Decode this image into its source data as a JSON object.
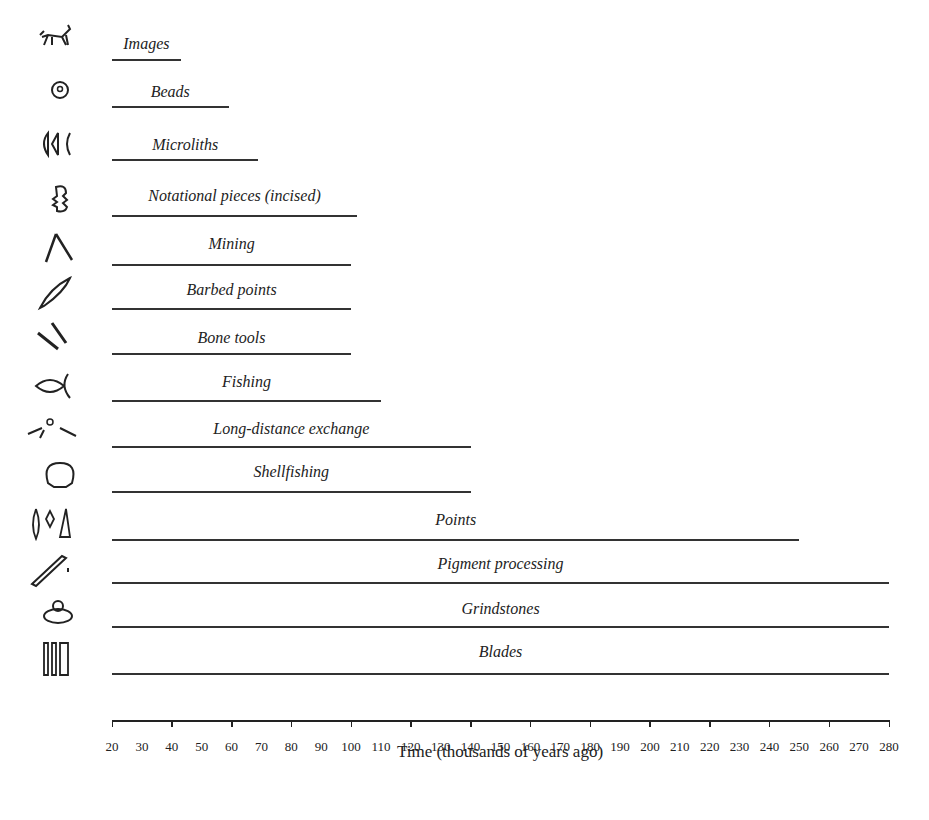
{
  "chart_data": {
    "type": "bar",
    "orientation": "horizontal-timeline",
    "title": "",
    "xlabel": "Time (thousands of years ago)",
    "ylabel": "",
    "xlim": [
      20,
      280
    ],
    "xticks": [
      20,
      30,
      40,
      50,
      60,
      70,
      80,
      90,
      100,
      110,
      120,
      130,
      140,
      150,
      160,
      170,
      180,
      190,
      200,
      210,
      220,
      230,
      240,
      250,
      260,
      270,
      280
    ],
    "grid": false,
    "legend": "none",
    "series": [
      {
        "name": "Images",
        "start": 20,
        "end": 43,
        "icon": "animal-figure-icon"
      },
      {
        "name": "Beads",
        "start": 20,
        "end": 59,
        "icon": "bead-icon"
      },
      {
        "name": "Microliths",
        "start": 20,
        "end": 69,
        "icon": "microliths-icon"
      },
      {
        "name": "Notational pieces (incised)",
        "start": 20,
        "end": 102,
        "icon": "incised-piece-icon"
      },
      {
        "name": "Mining",
        "start": 20,
        "end": 100,
        "icon": "pick-icon"
      },
      {
        "name": "Barbed points",
        "start": 20,
        "end": 100,
        "icon": "barbed-point-icon"
      },
      {
        "name": "Bone tools",
        "start": 20,
        "end": 100,
        "icon": "bone-tools-icon"
      },
      {
        "name": "Fishing",
        "start": 20,
        "end": 110,
        "icon": "fish-icon"
      },
      {
        "name": "Long-distance exchange",
        "start": 20,
        "end": 140,
        "icon": "hands-exchange-icon"
      },
      {
        "name": "Shellfishing",
        "start": 20,
        "end": 140,
        "icon": "shell-icon"
      },
      {
        "name": "Points",
        "start": 20,
        "end": 250,
        "icon": "points-icon"
      },
      {
        "name": "Pigment processing",
        "start": 20,
        "end": 280,
        "icon": "pigment-brush-icon"
      },
      {
        "name": "Grindstones",
        "start": 20,
        "end": 280,
        "icon": "grindstone-icon"
      },
      {
        "name": "Blades",
        "start": 20,
        "end": 280,
        "icon": "blades-icon"
      }
    ]
  },
  "colors": {
    "line": "#333333",
    "text": "#222222",
    "background": "#ffffff"
  }
}
